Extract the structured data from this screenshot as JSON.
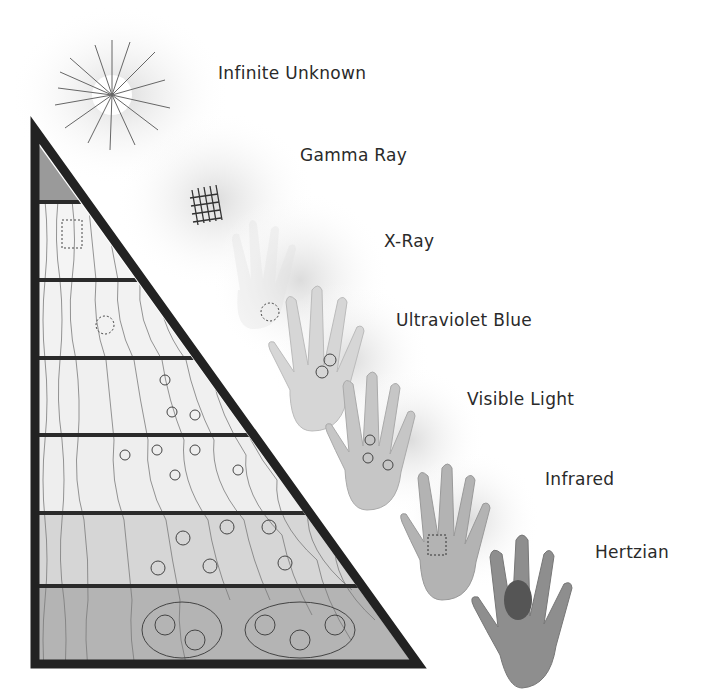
{
  "labels": [
    {
      "id": "infinite-unknown",
      "text": "Infinite Unknown",
      "x": 218,
      "y": 63
    },
    {
      "id": "gamma-ray",
      "text": "Gamma Ray",
      "x": 300,
      "y": 145
    },
    {
      "id": "x-ray",
      "text": "X-Ray",
      "x": 384,
      "y": 231
    },
    {
      "id": "ultraviolet-blue",
      "text": "Ultraviolet Blue",
      "x": 396,
      "y": 310
    },
    {
      "id": "visible-light",
      "text": "Visible Light",
      "x": 467,
      "y": 389
    },
    {
      "id": "infrared",
      "text": "Infrared",
      "x": 545,
      "y": 469
    },
    {
      "id": "hertzian",
      "text": "Hertzian",
      "x": 595,
      "y": 542
    }
  ],
  "pyramid": {
    "band_count": 7,
    "band_fills": [
      "#9a9a9a",
      "#f4f4f4",
      "#f2f2f2",
      "#f0f0f0",
      "#eeeeee",
      "#d6d6d6",
      "#b4b4b4"
    ],
    "outline_color": "#222222"
  },
  "hands": [
    {
      "id": "hand-x-ray",
      "shade": "#f2f2f2"
    },
    {
      "id": "hand-ultraviolet",
      "shade": "#d9d9d9"
    },
    {
      "id": "hand-visible",
      "shade": "#c7c7c7"
    },
    {
      "id": "hand-infrared",
      "shade": "#b5b5b5"
    },
    {
      "id": "hand-hertzian",
      "shade": "#8d8d8d"
    }
  ]
}
